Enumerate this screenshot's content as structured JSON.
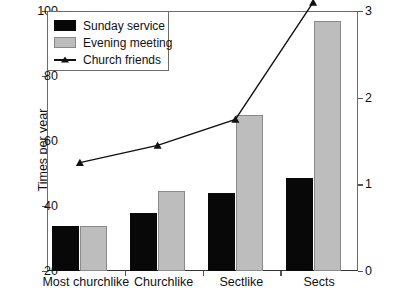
{
  "legend": {
    "position": "top-left-inside",
    "items": [
      {
        "label": "Sunday service",
        "marker": "filled-square",
        "color": "#080808"
      },
      {
        "label": "Evening meeting",
        "marker": "filled-square",
        "color": "#bdbdbd"
      },
      {
        "label": "Church friends",
        "marker": "line-with-triangle",
        "color": "#111111"
      }
    ]
  },
  "axes": {
    "left_title": "Times per year",
    "right_title": "Number of friends",
    "left_ticks": [
      "20",
      "40",
      "60",
      "80",
      "100"
    ],
    "right_ticks": [
      "0",
      "1",
      "2",
      "3"
    ]
  },
  "chart_data": {
    "type": "bar",
    "title": "",
    "xlabel": "",
    "ylabel": "Times per year",
    "y2label": "Number of friends",
    "ylim": [
      20,
      100
    ],
    "y2lim": [
      0,
      3
    ],
    "grid": false,
    "legend_position": "top-left-inside",
    "categories": [
      "Most churchlike",
      "Churchlike",
      "Sectlike",
      "Sects"
    ],
    "series": [
      {
        "name": "Sunday service",
        "type": "bar",
        "axis": "left",
        "color": "#080808",
        "values": [
          34,
          38,
          44,
          48.5
        ]
      },
      {
        "name": "Evening meeting",
        "type": "bar",
        "axis": "left",
        "color": "#bdbdbd",
        "values": [
          34,
          44.5,
          68,
          97
        ]
      },
      {
        "name": "Church friends",
        "type": "line",
        "axis": "right",
        "color": "#111111",
        "marker": "triangle",
        "values": [
          1.25,
          1.45,
          1.75,
          3.1
        ]
      }
    ]
  }
}
